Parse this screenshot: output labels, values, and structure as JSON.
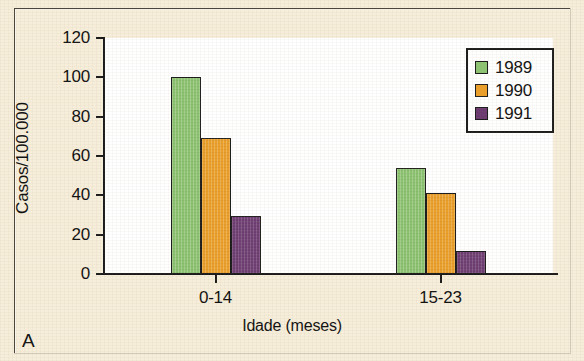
{
  "figure": {
    "panel_letter": "A",
    "background_color": "#f6eedb",
    "plot_background_color": "#ffffff"
  },
  "chart_data": {
    "type": "bar",
    "title": "",
    "subtitle": "",
    "xlabel": "Idade (meses)",
    "ylabel": "Casos/100.000",
    "categories": [
      "0-14",
      "15-23"
    ],
    "ylim": [
      0,
      120
    ],
    "yticks": [
      0,
      20,
      40,
      60,
      80,
      100,
      120
    ],
    "ytick_labels": [
      "0",
      "20",
      "40",
      "60",
      "80",
      "100",
      "120"
    ],
    "grid": false,
    "legend_position": "top-right",
    "series": [
      {
        "name": "1989",
        "color": "#8cc471",
        "values": [
          100,
          54
        ]
      },
      {
        "name": "1990",
        "color": "#eda029",
        "values": [
          69,
          41
        ]
      },
      {
        "name": "1991",
        "color": "#6b3a70",
        "values": [
          29.5,
          11.5
        ]
      }
    ]
  }
}
